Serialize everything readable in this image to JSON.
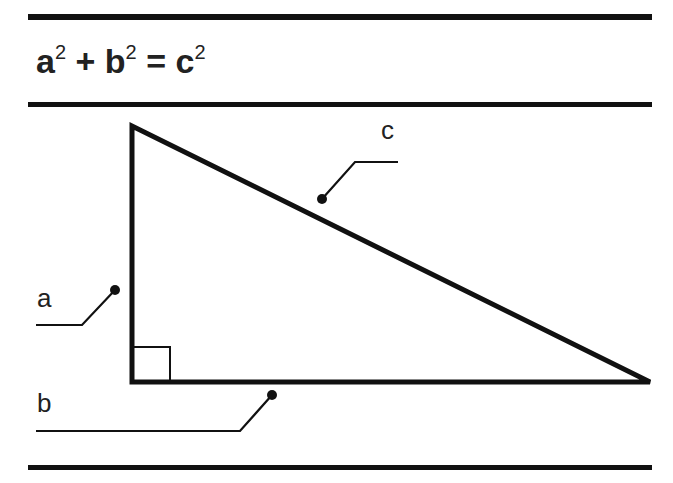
{
  "title": {
    "formula_parts": [
      {
        "base": "a",
        "exp": "2"
      },
      {
        "op": "+"
      },
      {
        "base": "b",
        "exp": "2"
      },
      {
        "op": "="
      },
      {
        "base": "c",
        "exp": "2"
      }
    ],
    "a": "a",
    "a_exp": "2",
    "plus": "+",
    "b": "b",
    "b_exp": "2",
    "equals": "=",
    "c": "c",
    "c_exp": "2"
  },
  "diagram": {
    "type": "right-triangle",
    "labels": {
      "a": "a",
      "b": "b",
      "c": "c"
    },
    "line_color": "#111111",
    "vertices": {
      "top": [
        132,
        126
      ],
      "right_angle": [
        132,
        382
      ],
      "right": [
        650,
        382
      ]
    }
  }
}
